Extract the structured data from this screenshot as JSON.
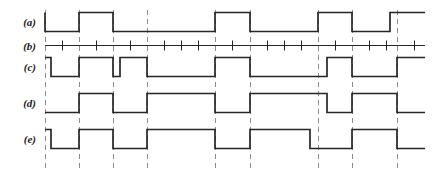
{
  "figure": {
    "type": "timing-diagram",
    "title": "",
    "background_color": "#ffffff",
    "waveform_color": "#262626",
    "gridline_color": "#8c8c8c",
    "width": 444,
    "height": 179
  },
  "labels": {
    "a": "(a)",
    "b": "(b)",
    "c": "(c)",
    "d": "(d)",
    "e": "(e)"
  },
  "chart_data": {
    "type": "line",
    "title": "",
    "xlabel": "",
    "ylabel": "",
    "x_start": 45,
    "x_end": 425,
    "bit_period": 17,
    "clock_period": 34,
    "gridlines": [
      45,
      79,
      113,
      147,
      215,
      250,
      318,
      352,
      397
    ],
    "tick_marks": [
      62,
      96,
      130,
      164,
      181,
      198,
      232,
      267,
      284,
      301,
      335,
      369,
      386,
      414
    ],
    "rows": [
      {
        "name": "a",
        "label": "(a)",
        "baseline_y": 31,
        "high_y": 12,
        "start_level": 1,
        "edges": [
          45,
          79,
          113,
          215,
          250,
          318,
          352,
          390
        ],
        "levels": [
          1,
          0,
          1,
          0,
          1,
          0,
          1,
          0,
          1,
          0
        ]
      },
      {
        "name": "b",
        "label": "(b)",
        "baseline_y": 45,
        "high_y": 45,
        "start_level": 0,
        "edges": [],
        "levels": [
          0
        ]
      },
      {
        "name": "c",
        "label": "(c)",
        "baseline_y": 76,
        "high_y": 57,
        "start_level": 1,
        "edges": [
          51,
          79,
          113,
          120,
          147,
          215,
          250,
          327,
          352,
          397
        ],
        "levels": [
          1,
          0,
          1,
          0,
          1,
          0,
          1,
          0,
          1,
          0,
          1,
          0
        ]
      },
      {
        "name": "d",
        "label": "(d)",
        "baseline_y": 112,
        "high_y": 93,
        "start_level": 0,
        "edges": [
          79,
          113,
          147,
          215,
          250,
          327,
          352,
          397
        ],
        "levels": [
          0,
          1,
          0,
          1,
          0,
          1,
          0,
          1,
          0
        ]
      },
      {
        "name": "e",
        "label": "(e)",
        "baseline_y": 148,
        "high_y": 129,
        "start_level": 1,
        "edges": [
          51,
          79,
          113,
          147,
          215,
          250,
          310,
          352,
          397
        ],
        "levels": [
          1,
          0,
          1,
          0,
          1,
          0,
          1,
          0,
          1,
          0
        ]
      }
    ],
    "grid": true,
    "legend": "none"
  }
}
